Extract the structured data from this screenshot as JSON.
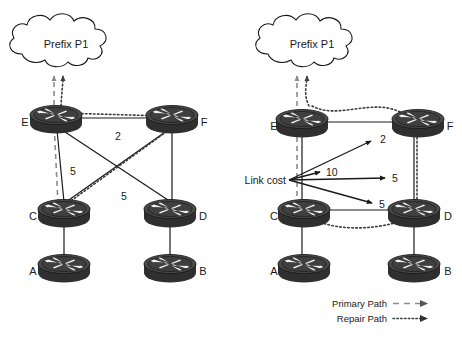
{
  "figure": {
    "title": "",
    "background_color": "#ffffff",
    "ink_color": "#1a1a1a",
    "primary_path_color": "#8c8c8c",
    "repair_path_color": "#3d3d3d",
    "router_body_color": "#3b3b3b",
    "router_top_color": "#5a5a5a"
  },
  "left_diagram": {
    "cloud": {
      "label": "Prefix P1"
    },
    "nodes": [
      {
        "id": "E",
        "label": "E"
      },
      {
        "id": "F",
        "label": "F"
      },
      {
        "id": "C",
        "label": "C"
      },
      {
        "id": "D",
        "label": "D"
      },
      {
        "id": "A",
        "label": "A"
      },
      {
        "id": "B",
        "label": "B"
      }
    ],
    "link_costs": [
      {
        "link": "E-F",
        "label": "2"
      },
      {
        "link": "E-C",
        "label": "5"
      },
      {
        "link": "F-C",
        "label": "5"
      }
    ],
    "paths": {
      "primary": "E to C (dashed, toward Prefix P1)",
      "repair": "E to F to C (dotted, toward Prefix P1)"
    }
  },
  "right_diagram": {
    "cloud": {
      "label": "Prefix P1"
    },
    "nodes": [
      {
        "id": "E",
        "label": "E"
      },
      {
        "id": "F",
        "label": "F"
      },
      {
        "id": "C",
        "label": "C"
      },
      {
        "id": "D",
        "label": "D"
      },
      {
        "id": "A",
        "label": "A"
      },
      {
        "id": "B",
        "label": "B"
      }
    ],
    "annotation": {
      "label": "Link cost"
    },
    "link_costs": [
      {
        "link": "E-F",
        "label": "2"
      },
      {
        "link": "E-C",
        "label": "10"
      },
      {
        "link": "F-D",
        "label": "5"
      },
      {
        "link": "C-D",
        "label": "5"
      }
    ],
    "paths": {
      "primary": "E to C (dashed, toward Prefix P1)",
      "repair": "E to F to D to C (dotted, toward Prefix P1)"
    }
  },
  "legend": {
    "items": [
      {
        "label": "Primary Path",
        "style": "dashed",
        "color": "#8c8c8c"
      },
      {
        "label": "Repair Path",
        "style": "dotted",
        "color": "#3d3d3d"
      }
    ]
  }
}
